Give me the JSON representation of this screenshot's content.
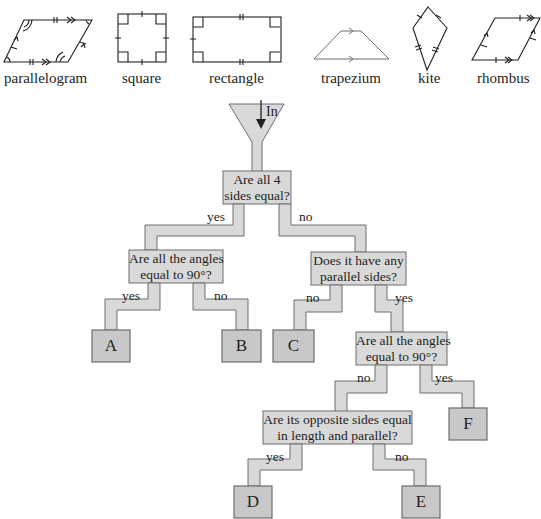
{
  "shapes": [
    {
      "id": "parallelogram",
      "label": "parallelogram"
    },
    {
      "id": "square",
      "label": "square"
    },
    {
      "id": "rectangle",
      "label": "rectangle"
    },
    {
      "id": "trapezium",
      "label": "trapezium"
    },
    {
      "id": "kite",
      "label": "kite"
    },
    {
      "id": "rhombus",
      "label": "rhombus"
    }
  ],
  "flowchart": {
    "input_label": "In",
    "questions": {
      "q1": {
        "line1": "Are all 4",
        "line2": "sides equal?"
      },
      "q2": {
        "line1": "Are all the angles",
        "line2": "equal to 90°?"
      },
      "q3": {
        "line1": "Does it have any",
        "line2": "parallel sides?"
      },
      "q4": {
        "line1": "Are all the angles",
        "line2": "equal to 90°?"
      },
      "q5": {
        "line1": "Are its opposite sides equal",
        "line2": "in length and parallel?"
      }
    },
    "branches": {
      "q1_yes": "yes",
      "q1_no": "no",
      "q2_yes": "yes",
      "q2_no": "no",
      "q3_no": "no",
      "q3_yes": "yes",
      "q4_no": "no",
      "q4_yes": "yes",
      "q5_yes": "yes",
      "q5_no": "no"
    },
    "outcomes": {
      "A": "A",
      "B": "B",
      "C": "C",
      "D": "D",
      "E": "E",
      "F": "F"
    },
    "colors": {
      "pipe_fill": "#d9d9d9",
      "pipe_stroke": "#6d6e71",
      "outcome_fill": "#c8c8c8"
    }
  }
}
